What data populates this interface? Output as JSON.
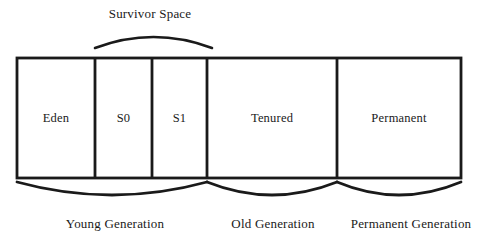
{
  "diagram": {
    "title": "Survivor Space",
    "colors": {
      "stroke": "#1a1a1a",
      "background": "#ffffff",
      "text": "#1a1a1a"
    },
    "top_brace": {
      "label": "Survivor Space",
      "spans": [
        "S0",
        "S1"
      ],
      "label_x": 150,
      "label_y": 14,
      "arc_left_x": 95,
      "arc_right_x": 212,
      "arc_base_y": 48,
      "arc_peak_y": 33
    },
    "memory_bar": {
      "left": 17,
      "right": 461,
      "top": 58,
      "bottom": 178,
      "segments": [
        {
          "name": "Eden",
          "label": "Eden",
          "left": 17,
          "right": 95,
          "center_x": 56
        },
        {
          "name": "S0",
          "label": "S0",
          "left": 95,
          "right": 152,
          "center_x": 123.5
        },
        {
          "name": "S1",
          "label": "S1",
          "left": 152,
          "right": 207,
          "center_x": 179.5
        },
        {
          "name": "Tenured",
          "label": "Tenured",
          "left": 207,
          "right": 337,
          "center_x": 272
        },
        {
          "name": "Permanent",
          "label": "Permanent",
          "left": 337,
          "right": 461,
          "center_x": 399
        }
      ],
      "dividers": [
        95,
        152,
        207,
        337
      ],
      "label_y": 118
    },
    "bottom_braces": [
      {
        "name": "young-generation",
        "label": "Young Generation",
        "left": 17,
        "right": 207,
        "top_y": 182,
        "dip_y": 204,
        "label_x": 115,
        "label_y": 224
      },
      {
        "name": "old-generation",
        "label": "Old Generation",
        "left": 207,
        "right": 337,
        "top_y": 182,
        "dip_y": 204,
        "label_x": 273,
        "label_y": 224
      },
      {
        "name": "permanent-generation",
        "label": "Permanent Generation",
        "left": 337,
        "right": 461,
        "top_y": 182,
        "dip_y": 204,
        "label_x": 411,
        "label_y": 224
      }
    ]
  }
}
